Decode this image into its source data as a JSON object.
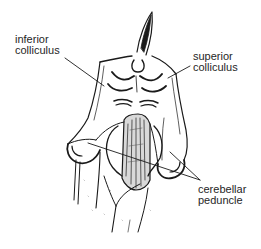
{
  "diagram": {
    "line_color": "#1a1a1a",
    "text_color": "#262626",
    "background": "#ffffff",
    "labels": [
      {
        "id": "inferior-colliculus",
        "lines": [
          "inferior",
          "colliculus"
        ]
      },
      {
        "id": "superior-colliculus",
        "lines": [
          "superior",
          "colliculus"
        ]
      },
      {
        "id": "cerebellar-peduncle",
        "lines": [
          "cerebellar",
          "peduncle"
        ]
      }
    ]
  }
}
